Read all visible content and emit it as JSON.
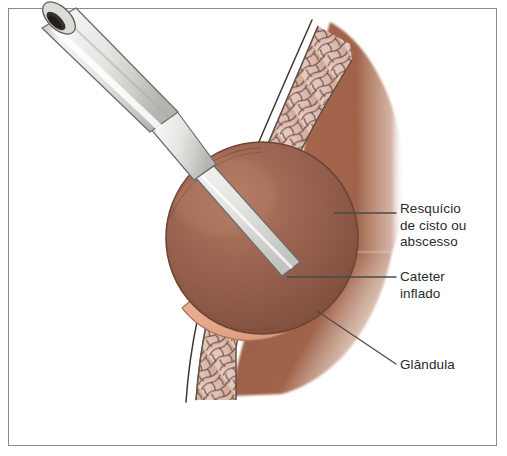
{
  "figure": {
    "type": "medical-illustration",
    "language": "pt-BR",
    "frame_color": "#8a8a8a",
    "background_color": "#ffffff"
  },
  "labels": [
    {
      "id": "cyst-remnant",
      "text": "Resquício\nde cisto ou\nabscesso",
      "lines": [
        "Resquício",
        "de cisto ou",
        "abscesso"
      ],
      "color": "#2b2b2b",
      "leader": {
        "type": "horizontal",
        "from_x": 334,
        "from_y": 213,
        "to_x": 396,
        "to_y": 213
      }
    },
    {
      "id": "inflated-catheter",
      "text": "Cateter\ninflado",
      "lines": [
        "Cateter",
        "inflado"
      ],
      "color": "#2b2b2b",
      "leader": {
        "type": "horizontal",
        "from_x": 287,
        "from_y": 277,
        "to_x": 396,
        "to_y": 277
      }
    },
    {
      "id": "gland",
      "text": "Glândula",
      "lines": [
        "Glândula"
      ],
      "color": "#2b2b2b",
      "leader": {
        "type": "diagonal",
        "from_x": 317,
        "from_y": 311,
        "to_x": 396,
        "to_y": 364
      }
    }
  ],
  "anatomy": [
    {
      "id": "catheter-tube",
      "name": "Cateter de Word",
      "color": "#e9e9e6",
      "outline": "#6d6d6d"
    },
    {
      "id": "catheter-lumen",
      "name": "Lúmen do cateter",
      "color": "#3a3230"
    },
    {
      "id": "balloon",
      "name": "Balão inflado",
      "color": "#9c6450"
    },
    {
      "id": "cyst-rim",
      "name": "Resquício de cisto ou abscesso",
      "color": "#e2a183"
    },
    {
      "id": "gland-tissue",
      "name": "Glândula",
      "color": "#c0a197"
    },
    {
      "id": "muscle-tissue",
      "name": "Tecido muscular",
      "color": "#a0634a"
    },
    {
      "id": "fat-layer",
      "name": "Tecido subcutâneo",
      "color": "#dfc0b4"
    },
    {
      "id": "skin-line",
      "name": "Pele / mucosa",
      "color": "#4a4038"
    }
  ],
  "colors": {
    "balloon_dark": "#8a5743",
    "balloon_mid": "#9c6450",
    "balloon_light": "#ab7460",
    "cyst_rim": "#e2a183",
    "cyst_rim_light": "#eebb9f",
    "gland": "#c0a197",
    "gland_light": "#cdb0a6",
    "muscle": "#a0634a",
    "muscle_deep": "#8d5238",
    "fat_cell": "#dfc0b4",
    "fat_line": "#6b4a40",
    "skin": "#4a4038",
    "tube_body": "#ececea",
    "tube_shade": "#c9c9c6",
    "tube_outline": "#6d6d6d",
    "lumen": "#3a3230",
    "label_text": "#2b2b2b",
    "leader_line": "#4a4a4a",
    "frame": "#8a8a8a"
  }
}
